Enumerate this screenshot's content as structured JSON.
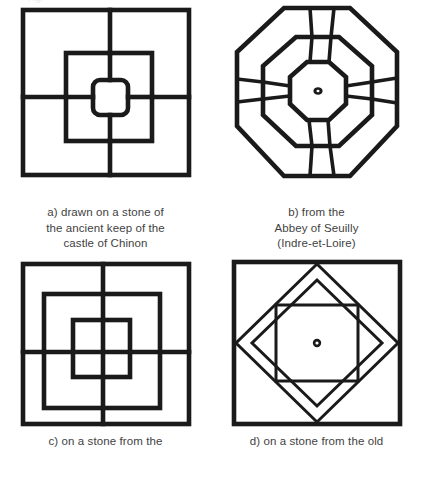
{
  "page": {
    "background_color": "#ffffff",
    "ink_color": "#1a1a1a",
    "caption_color": "#3f3f3f",
    "top_cutoff_text": "Fig."
  },
  "figures": [
    {
      "id": "a",
      "name": "three-nested-squares-with-cross",
      "description": "Three concentric squares joined by a cross of four radial bars",
      "caption_lines": [
        "a) drawn on a stone of",
        "the ancient keep of the",
        "castle of Chinon"
      ]
    },
    {
      "id": "b",
      "name": "three-nested-octagons-with-spokes",
      "description": "Three concentric octagons joined by four tapered radial spokes, small dot at the centre",
      "caption_lines": [
        "b) from the",
        "Abbey of Seuilly",
        "(Indre-et-Loire)"
      ]
    },
    {
      "id": "c",
      "name": "three-nested-squares-with-full-cross",
      "description": "Three concentric squares crossed by a full vertical and a full horizontal line",
      "caption_lines": [
        "c) on a stone from the"
      ]
    },
    {
      "id": "d",
      "name": "square-diamond-square-with-centre-dot",
      "description": "Outer square, a banded rotated diamond and an inner square with a dot at the centre",
      "caption_lines": [
        "d) on a stone from the old"
      ]
    }
  ]
}
